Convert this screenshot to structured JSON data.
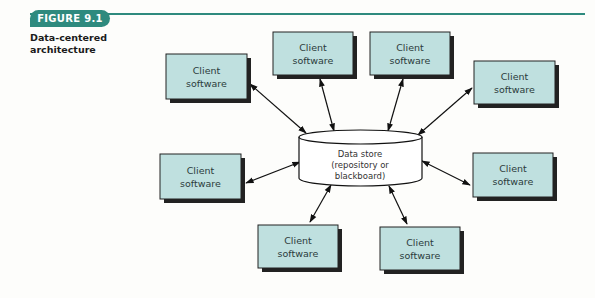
{
  "figure": {
    "tab_label": "FIGURE 9.1",
    "caption_line1": "Data-centered",
    "caption_line2": "architecture",
    "accent_color": "#2e8a7e"
  },
  "diagram": {
    "box_fill": "#bfe0df",
    "box_shadow": "#222222",
    "data_store": {
      "line1": "Data store",
      "line2": "(repository or",
      "line3": "blackboard)"
    },
    "clients": [
      {
        "id": "client-1",
        "line1": "Client",
        "line2": "software"
      },
      {
        "id": "client-2",
        "line1": "Client",
        "line2": "software"
      },
      {
        "id": "client-3",
        "line1": "Client",
        "line2": "software"
      },
      {
        "id": "client-4",
        "line1": "Client",
        "line2": "software"
      },
      {
        "id": "client-5",
        "line1": "Client",
        "line2": "software"
      },
      {
        "id": "client-6",
        "line1": "Client",
        "line2": "software"
      },
      {
        "id": "client-7",
        "line1": "Client",
        "line2": "software"
      },
      {
        "id": "client-8",
        "line1": "Client",
        "line2": "software"
      }
    ]
  }
}
